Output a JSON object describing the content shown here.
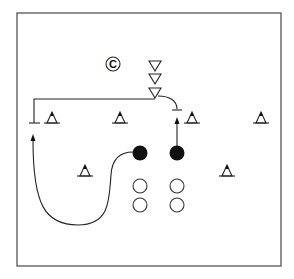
{
  "diagram": {
    "title": "",
    "canvas": {
      "width": 294,
      "height": 279,
      "background": "#ffffff"
    },
    "field": {
      "x": 17,
      "y": 13,
      "width": 264,
      "height": 253,
      "stroke": "#555555"
    },
    "coach": {
      "label": "C",
      "x": 113,
      "y": 64,
      "r": 7
    },
    "defenders_stack": [
      {
        "x": 155,
        "y": 66
      },
      {
        "x": 155,
        "y": 79
      },
      {
        "x": 155,
        "y": 93
      }
    ],
    "cones": [
      {
        "x": 52,
        "y": 121
      },
      {
        "x": 120,
        "y": 121
      },
      {
        "x": 192,
        "y": 121
      },
      {
        "x": 261,
        "y": 121
      },
      {
        "x": 85,
        "y": 172
      },
      {
        "x": 227,
        "y": 172
      }
    ],
    "players_with_ball": [
      {
        "x": 140,
        "y": 153
      },
      {
        "x": 177,
        "y": 153
      }
    ],
    "players_waiting": [
      {
        "x": 140,
        "y": 186
      },
      {
        "x": 177,
        "y": 186
      },
      {
        "x": 140,
        "y": 205
      },
      {
        "x": 177,
        "y": 205
      }
    ],
    "routes": [
      {
        "name": "defender-left-block",
        "type": "block-line"
      },
      {
        "name": "defender-right-curve",
        "type": "block-curve"
      },
      {
        "name": "player-right-forward",
        "type": "arrow"
      },
      {
        "name": "player-left-curl",
        "type": "arrow-curve"
      }
    ],
    "legend": {
      "triangle_down": "defender",
      "triangle_cone": "cone",
      "filled_circle": "attacker with ball",
      "open_circle": "waiting player",
      "circled_c": "coach"
    }
  }
}
